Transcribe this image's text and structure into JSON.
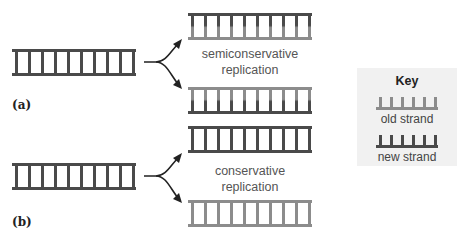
{
  "colors": {
    "old_strand": "#8c8c8c",
    "new_strand": "#4a4a4a",
    "key_bg": "#f1f1f1"
  },
  "panels": [
    {
      "label": "(a)",
      "caption_line1": "semiconservative",
      "caption_line2": "replication"
    },
    {
      "label": "(b)",
      "caption_line1": "conservative",
      "caption_line2": "replication"
    }
  ],
  "key": {
    "title": "Key",
    "old_label": "old strand",
    "new_label": "new strand"
  }
}
